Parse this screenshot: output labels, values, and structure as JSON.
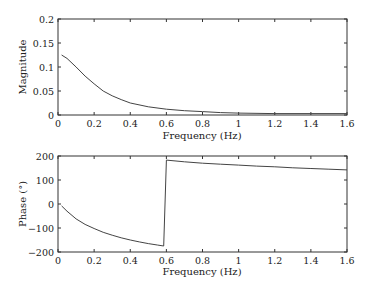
{
  "chart_data": [
    {
      "type": "line",
      "title": "",
      "xlabel": "Frequency (Hz)",
      "ylabel": "Magnitude",
      "xlim": [
        0,
        1.6
      ],
      "ylim": [
        0,
        0.2
      ],
      "grid": false,
      "legend": null,
      "x_ticks": [
        "0",
        "0.2",
        "0.4",
        "0.6",
        "0.8",
        "1",
        "1.2",
        "1.4",
        "1.6"
      ],
      "y_ticks": [
        "0",
        "0.05",
        "0.1",
        "0.15",
        "0.2"
      ],
      "series": [
        {
          "name": "magnitude",
          "x": [
            0.02,
            0.05,
            0.1,
            0.15,
            0.2,
            0.25,
            0.3,
            0.35,
            0.4,
            0.5,
            0.6,
            0.7,
            0.8,
            0.9,
            1.0,
            1.2,
            1.4,
            1.6
          ],
          "y": [
            0.125,
            0.118,
            0.1,
            0.081,
            0.065,
            0.05,
            0.04,
            0.032,
            0.025,
            0.017,
            0.012,
            0.009,
            0.007,
            0.005,
            0.004,
            0.003,
            0.003,
            0.003
          ]
        }
      ]
    },
    {
      "type": "line",
      "title": "",
      "xlabel": "Frequency (Hz)",
      "ylabel": "Phase (°)",
      "xlim": [
        0,
        1.6
      ],
      "ylim": [
        -200,
        200
      ],
      "grid": false,
      "legend": null,
      "x_ticks": [
        "0",
        "0.2",
        "0.4",
        "0.6",
        "0.8",
        "1",
        "1.2",
        "1.4",
        "1.6"
      ],
      "y_ticks": [
        "−200",
        "−100",
        "0",
        "100",
        "200"
      ],
      "series": [
        {
          "name": "phase",
          "x": [
            0.02,
            0.05,
            0.1,
            0.15,
            0.2,
            0.25,
            0.3,
            0.35,
            0.4,
            0.45,
            0.5,
            0.55,
            0.585,
            0.6,
            0.7,
            0.8,
            0.9,
            1.0,
            1.1,
            1.2,
            1.3,
            1.4,
            1.5,
            1.6
          ],
          "y": [
            -8,
            -30,
            -62,
            -85,
            -102,
            -118,
            -130,
            -141,
            -150,
            -158,
            -165,
            -171,
            -175,
            183,
            176,
            170,
            166,
            162,
            158,
            155,
            151,
            148,
            145,
            142
          ]
        }
      ]
    }
  ]
}
